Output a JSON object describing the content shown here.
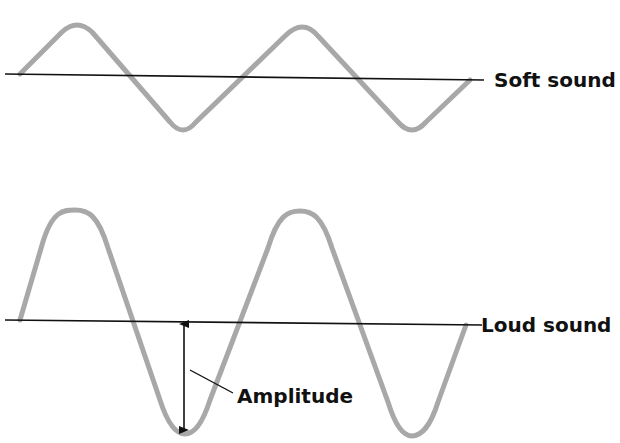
{
  "diagram": {
    "type": "sound-wave-amplitude-comparison",
    "colors": {
      "background": "#ffffff",
      "wave": "#a8a8a8",
      "baseline": "#111111",
      "text": "#111111"
    },
    "waves": [
      {
        "id": "soft",
        "label": "Soft sound",
        "baseline_y": 77,
        "amplitude_px": 55,
        "cycles": 2
      },
      {
        "id": "loud",
        "label": "Loud sound",
        "baseline_y": 322,
        "amplitude_px": 112,
        "cycles": 2
      }
    ],
    "annotation": {
      "label": "Amplitude",
      "indicator": "double-headed-arrow"
    }
  }
}
